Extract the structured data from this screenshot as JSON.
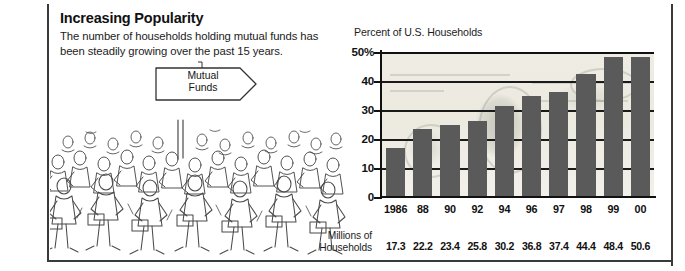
{
  "headline": {
    "title": "Increasing Popularity",
    "deck_line1": "The number of households holding mutual funds has",
    "deck_line2": "been steadily growing over the past 15 years."
  },
  "illustration": {
    "name": "crowd-of-people",
    "sign_line1": "Mutual",
    "sign_line2": "Funds"
  },
  "chart_data": {
    "type": "bar",
    "title": "Percent of U.S. Households",
    "xlabel": "",
    "ylabel": "Percent of U.S. Households",
    "categories": [
      "1986",
      "88",
      "90",
      "92",
      "94",
      "96",
      "97",
      "98",
      "99",
      "00"
    ],
    "values": [
      17.0,
      23.4,
      24.7,
      26.1,
      31.4,
      35.0,
      36.2,
      42.3,
      48.2,
      48.4
    ],
    "ylim": [
      0,
      50
    ],
    "yticks": [
      "50%",
      "40",
      "30",
      "20",
      "10",
      "0"
    ],
    "ytick_values": [
      50,
      40,
      30,
      20,
      10,
      0
    ],
    "grid": true,
    "legend": "none",
    "bar_color": "#5a5a5a",
    "background_note": "faded U.S. $100 bill watermark",
    "secondary_row": {
      "label_line1": "Millions of",
      "label_line2": "Households",
      "values": [
        "17.3",
        "22.2",
        "23.4",
        "25.8",
        "30.2",
        "36.8",
        "37.4",
        "44.4",
        "48.4",
        "50.6"
      ]
    }
  }
}
